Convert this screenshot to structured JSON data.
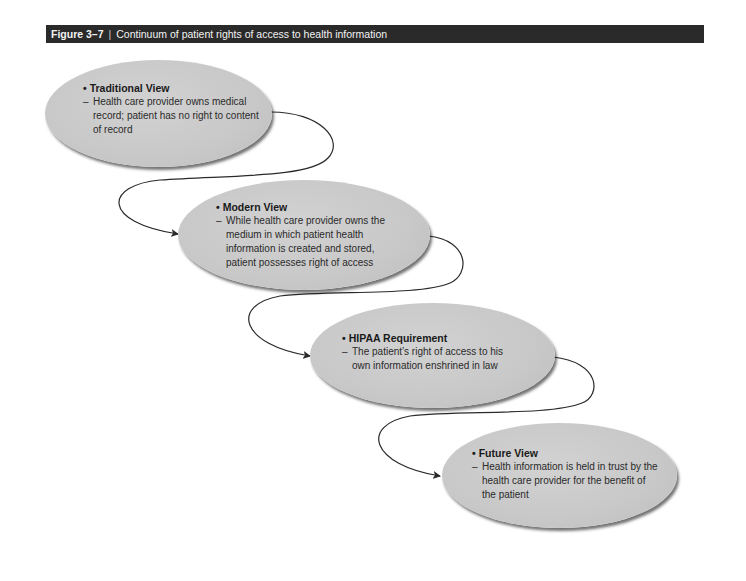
{
  "figure": {
    "number": "Figure 3–7",
    "separator": "|",
    "title": "Continuum of patient rights of access to health information",
    "title_bar_color": "#2a2a2a"
  },
  "nodes": [
    {
      "heading": "Traditional View",
      "description": "Health care provider owns medical record; patient has no right to content of record"
    },
    {
      "heading": "Modern View",
      "description": "While health care provider owns the medium in which patient health information is created and stored, patient possesses right of access"
    },
    {
      "heading": "HIPAA Requirement",
      "description": "The patient’s right of access to his own information enshrined in law"
    },
    {
      "heading": "Future View",
      "description": "Health information is held in trust by the health care provider for the benefit of the patient"
    }
  ],
  "markers": {
    "bullet": "•",
    "dash": "–"
  },
  "connectors": [
    {
      "from": "Traditional View",
      "to": "Modern View"
    },
    {
      "from": "Modern View",
      "to": "HIPAA Requirement"
    },
    {
      "from": "HIPAA Requirement",
      "to": "Future View"
    }
  ]
}
